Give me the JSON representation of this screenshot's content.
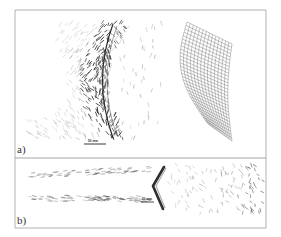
{
  "figure": {
    "panels": [
      {
        "id": "a",
        "label": "a)",
        "scale_bar_label": "50 mm",
        "description": "Particle velocity vectors around a curved shock front with deformed mesh grid"
      },
      {
        "id": "b",
        "label": "b)",
        "scale_bar_label": "50 mm",
        "description": "Particle velocity vectors around a chevron-shaped front"
      }
    ],
    "colors": {
      "frame": "#9a9a9a",
      "vectors": "#6a6a6a",
      "front": "#2a2a2a",
      "grid": "#555555"
    }
  }
}
